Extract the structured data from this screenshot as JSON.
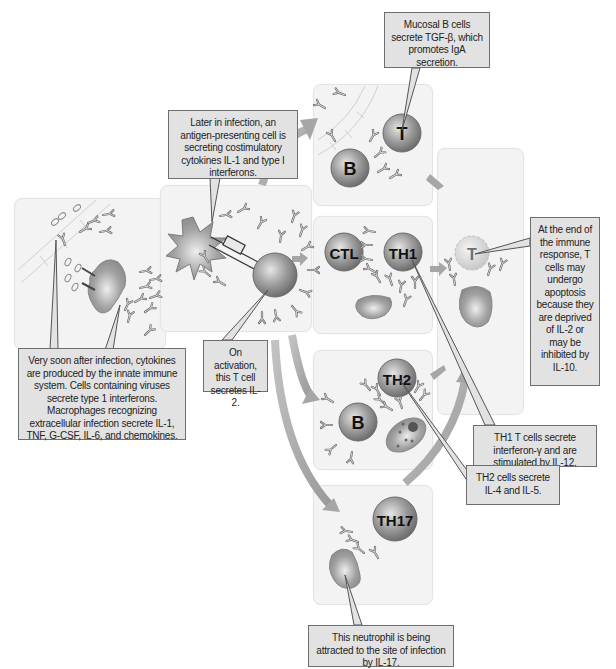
{
  "colors": {
    "panel_bg": "#f3f3f3",
    "callout_bg": "#e2e2e2",
    "callout_border": "#6e6e6e",
    "cell_gray": "#8c8c8c",
    "arrow_gray": "#a8a8a8"
  },
  "cells": {
    "b_mucosal": "B",
    "t_mucosal": "T",
    "ctl": "CTL",
    "th1": "TH1",
    "th2": "TH2",
    "b_th2": "B",
    "th17": "TH17",
    "t_apoptotic": "T"
  },
  "callouts": {
    "mucosal": "Mucosal B cells secrete TGF-β, which promotes IgA secretion.",
    "apc": "Later in infection, an antigen-presenting cell is secreting costimulatory cytokines IL-1 and type I interferons.",
    "innate": "Very soon after infection, cytokines are produced by the innate immune system. Cells containing viruses secrete type 1 interferons. Macrophages recognizing extracellular infection secrete IL-1, TNF, G-CSF, IL-6, and chemokines.",
    "activation": "On activation, this T cell secretes IL-2.",
    "end_response": "At the end of the immune response, T cells may undergo apoptosis because they are deprived of IL-2 or may be inhibited by IL-10.",
    "th1": "TH1 T cells secrete interferon-γ and are stimulated by IL-12.",
    "th2": "TH2 cells secrete IL-4 and IL-5.",
    "neutrophil": "This neutrophil is being attracted to the site of infection by IL-17."
  }
}
